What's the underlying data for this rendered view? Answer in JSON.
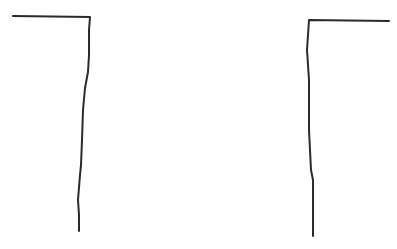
{
  "canvas": {
    "width": 397,
    "height": 249,
    "background": "#ffffff",
    "stroke_color": "#2b2b2b",
    "stroke_width": 2
  },
  "strokes": [
    {
      "name": "left-bracket",
      "path": "M13,16 L90,17 L89,30 L89,55 L88,72 L85,88 L83,110 L82,140 L81,165 L80,175 L78,200 L79,215 L79,231"
    },
    {
      "name": "right-bracket",
      "path": "M389,21 L309,20 L308,35 L307,50 L308,65 L309,80 L309,100 L309,130 L310,150 L311,170 L313,180 L313,200 L313,220 L313,236"
    }
  ]
}
